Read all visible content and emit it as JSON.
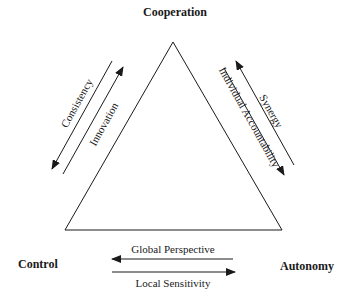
{
  "diagram": {
    "vertices": {
      "top": "Cooperation",
      "bottom_left": "Control",
      "bottom_right": "Autonomy"
    },
    "edges": {
      "left": {
        "outer_arrow": {
          "label": "Consistency",
          "direction": "toward Control"
        },
        "inner_arrow": {
          "label": "Innovation",
          "direction": "toward Cooperation"
        }
      },
      "right": {
        "outer_arrow": {
          "label": "Synergy",
          "direction": "toward Cooperation"
        },
        "inner_arrow": {
          "label": "Individual Accountability",
          "direction": "toward Autonomy"
        }
      },
      "bottom": {
        "upper_arrow": {
          "label": "Global Perspective",
          "direction": "toward Control"
        },
        "lower_arrow": {
          "label": "Local Sensitivity",
          "direction": "toward Autonomy"
        }
      }
    },
    "colors": {
      "line": "#1a1a1a",
      "background": "#ffffff"
    }
  }
}
